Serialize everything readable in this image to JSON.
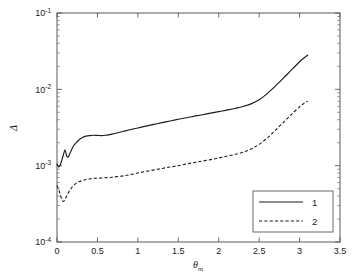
{
  "figure": {
    "type": "log-y-line-plot",
    "background": "#ffffff",
    "axis_color": "#555a5e",
    "line_color": "#1c1c1c"
  },
  "axes": {
    "x_label": "θ",
    "x_label_sub": "m",
    "y_label": "Δ",
    "x_ticks": [
      "0",
      "0.5",
      "1",
      "1.5",
      "2",
      "2.5",
      "3",
      "3.5"
    ],
    "x_tick_values": [
      0,
      0.5,
      1,
      1.5,
      2,
      2.5,
      3,
      3.5
    ],
    "y_ticks": [
      "10⁻¹",
      "10⁻²",
      "10⁻³",
      "10⁻⁴"
    ],
    "y_tick_mantissa": [
      "10",
      "10",
      "10",
      "10"
    ],
    "y_tick_exponents": [
      "-1",
      "-2",
      "-3",
      "-4"
    ],
    "y_tick_values": [
      0.1,
      0.01,
      0.001,
      0.0001
    ]
  },
  "legend": {
    "position": "bottom-right",
    "entries": [
      {
        "label": "1",
        "style": "solid"
      },
      {
        "label": "2",
        "style": "dashed"
      }
    ]
  },
  "caption": {
    "text": ""
  },
  "chart_data": {
    "type": "line",
    "title": "",
    "xlabel": "θ_m",
    "ylabel": "Δ",
    "xlim": [
      0,
      3.5
    ],
    "ylim": [
      0.0001,
      0.1
    ],
    "yscale": "log",
    "xscale": "linear",
    "grid": false,
    "legend_position": "lower right",
    "series": [
      {
        "name": "1",
        "style": "solid",
        "color": "#1c1c1c",
        "x": [
          0.0,
          0.02,
          0.04,
          0.06,
          0.08,
          0.1,
          0.12,
          0.14,
          0.16,
          0.18,
          0.2,
          0.24,
          0.28,
          0.32,
          0.36,
          0.4,
          0.45,
          0.5,
          0.55,
          0.6,
          0.65,
          0.7,
          0.8,
          0.9,
          1.0,
          1.1,
          1.2,
          1.3,
          1.4,
          1.5,
          1.6,
          1.7,
          1.8,
          1.9,
          2.0,
          2.1,
          2.2,
          2.3,
          2.4,
          2.5,
          2.6,
          2.7,
          2.8,
          2.9,
          3.0,
          3.05,
          3.1
        ],
        "y": [
          0.00105,
          0.00096,
          0.00102,
          0.00118,
          0.0014,
          0.0016,
          0.00134,
          0.0013,
          0.00145,
          0.00162,
          0.00178,
          0.00202,
          0.00222,
          0.00236,
          0.00244,
          0.00248,
          0.0025,
          0.00249,
          0.00248,
          0.0025,
          0.00255,
          0.00262,
          0.00278,
          0.00295,
          0.00312,
          0.0033,
          0.00348,
          0.00366,
          0.00385,
          0.00405,
          0.00425,
          0.00445,
          0.00465,
          0.00488,
          0.0051,
          0.00535,
          0.00562,
          0.00595,
          0.00645,
          0.0073,
          0.0088,
          0.011,
          0.014,
          0.018,
          0.023,
          0.0255,
          0.028
        ]
      },
      {
        "name": "2",
        "style": "dashed",
        "color": "#1c1c1c",
        "x": [
          0.0,
          0.02,
          0.04,
          0.06,
          0.08,
          0.1,
          0.12,
          0.14,
          0.16,
          0.18,
          0.2,
          0.24,
          0.28,
          0.32,
          0.36,
          0.4,
          0.45,
          0.5,
          0.55,
          0.6,
          0.65,
          0.7,
          0.8,
          0.9,
          1.0,
          1.1,
          1.2,
          1.3,
          1.4,
          1.5,
          1.6,
          1.7,
          1.8,
          1.9,
          2.0,
          2.1,
          2.2,
          2.3,
          2.4,
          2.5,
          2.6,
          2.7,
          2.8,
          2.9,
          3.0,
          3.05,
          3.1
        ],
        "y": [
          0.00055,
          0.00049,
          0.00042,
          0.00036,
          0.00034,
          0.00036,
          0.0004,
          0.00044,
          0.00048,
          0.00051,
          0.00054,
          0.00059,
          0.00062,
          0.00064,
          0.00066,
          0.00067,
          0.00068,
          0.000685,
          0.00069,
          0.000695,
          0.0007,
          0.00071,
          0.00073,
          0.00076,
          0.0008,
          0.00084,
          0.00088,
          0.00092,
          0.00096,
          0.001,
          0.00105,
          0.0011,
          0.00115,
          0.0012,
          0.00126,
          0.00133,
          0.0014,
          0.0015,
          0.00165,
          0.0019,
          0.0023,
          0.0029,
          0.0037,
          0.0047,
          0.0059,
          0.0065,
          0.007
        ]
      }
    ]
  }
}
